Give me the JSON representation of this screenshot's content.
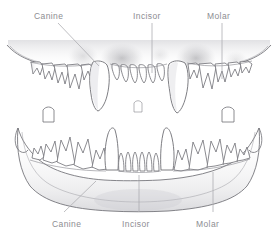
{
  "figure": {
    "kind": "anatomical-illustration",
    "background_color": "#ffffff",
    "line_color": "#6f6f75",
    "label_color": "#8d8d92",
    "shade_color": "#b9b9bd",
    "leader_color": "#a9a9ae"
  },
  "labels": {
    "top": [
      {
        "id": "canine-top",
        "text": "Canine",
        "x": 34,
        "y": 11
      },
      {
        "id": "incisor-top",
        "text": "Incisor",
        "x": 133,
        "y": 11
      },
      {
        "id": "molar-top",
        "text": "Molar",
        "x": 207,
        "y": 11
      }
    ],
    "bottom": [
      {
        "id": "canine-bottom",
        "text": "Canine",
        "x": 52,
        "y": 219
      },
      {
        "id": "incisor-bottom",
        "text": "Incisor",
        "x": 122,
        "y": 219
      },
      {
        "id": "molar-bottom",
        "text": "Molar",
        "x": 196,
        "y": 219
      }
    ]
  },
  "leaders": [
    {
      "id": "leader-canine-top",
      "type": "diagonal",
      "x1": 58,
      "y1": 23,
      "x2": 99,
      "y2": 66
    },
    {
      "id": "leader-incisor-top",
      "type": "vertical",
      "x1": 152,
      "y1": 23,
      "x2": 152,
      "y2": 73
    },
    {
      "id": "leader-molar-top",
      "type": "vertical",
      "x1": 222,
      "y1": 23,
      "x2": 222,
      "y2": 79
    },
    {
      "id": "leader-canine-bottom",
      "type": "diagonal",
      "x1": 64,
      "y1": 212,
      "x2": 96,
      "y2": 181
    },
    {
      "id": "leader-incisor-bottom",
      "type": "vertical",
      "x1": 139,
      "y1": 212,
      "x2": 139,
      "y2": 175
    },
    {
      "id": "leader-molar-bottom",
      "type": "vertical",
      "x1": 213,
      "y1": 212,
      "x2": 213,
      "y2": 172
    }
  ],
  "anatomy": {
    "upper_jaw": {
      "name": "upper-jaw",
      "tooth_groups": [
        {
          "name": "upper-left-molars",
          "count": 5
        },
        {
          "name": "upper-left-canine",
          "count": 1
        },
        {
          "name": "upper-incisors",
          "count": 6
        },
        {
          "name": "upper-right-canine",
          "count": 1
        },
        {
          "name": "upper-right-molars",
          "count": 5
        }
      ]
    },
    "lower_jaw": {
      "name": "lower-jaw",
      "tooth_groups": [
        {
          "name": "lower-left-molars",
          "count": 5
        },
        {
          "name": "lower-left-canine",
          "count": 1
        },
        {
          "name": "lower-incisors",
          "count": 6
        },
        {
          "name": "lower-right-canine",
          "count": 1
        },
        {
          "name": "lower-right-molars",
          "count": 5
        }
      ]
    }
  }
}
